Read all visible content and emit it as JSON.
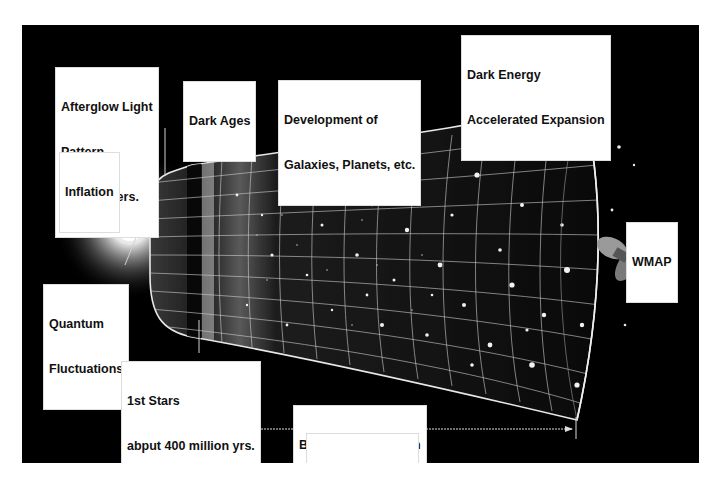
{
  "diagram": {
    "labels": {
      "afterglow": {
        "line1": "Afterglow Light",
        "line2": "Pattern",
        "line3": "380,000 yers."
      },
      "dark_ages": {
        "line1": "Dark Ages"
      },
      "development": {
        "line1": "Development of",
        "line2": "Galaxies, Planets, etc."
      },
      "dark_energy": {
        "line1": "Dark Energy",
        "line2": "Accelerated Expansion"
      },
      "inflation": {
        "line1": "Inflation"
      },
      "wmap": {
        "line1": "WMAP"
      },
      "quantum": {
        "line1": "Quantum",
        "line2": "Fluctuations"
      },
      "first_stars": {
        "line1": "1st Stars",
        "line2": "abput 400 million yrs."
      },
      "expansion": {
        "line1": "Big Bang Expansion"
      },
      "duration": {
        "line1": "13.7 billion years"
      }
    },
    "icons": {
      "big_bang": "bright-flash",
      "satellite": "wmap-satellite"
    },
    "colors": {
      "background": "#000000",
      "frame": "#ffffff",
      "grid": "#d8d8d8",
      "label_bg": "#ffffff",
      "label_text": "#111111"
    }
  }
}
